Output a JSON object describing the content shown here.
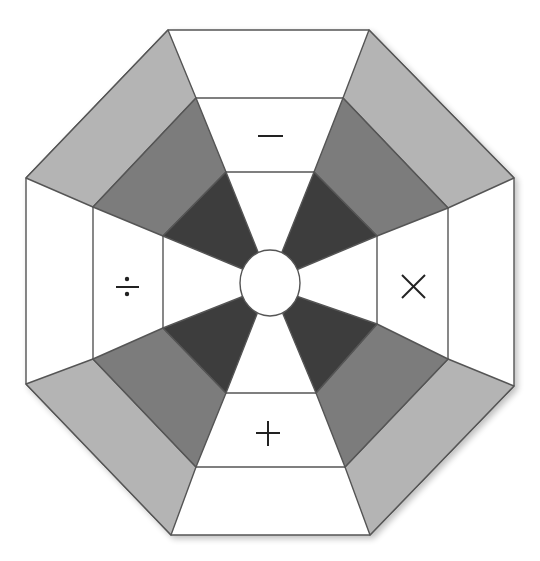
{
  "diagram": {
    "title": "",
    "shape": "octagon",
    "colors": {
      "background": "#ffffff",
      "white_segment": "#ffffff",
      "light_gray": "#b4b4b4",
      "mid_gray": "#7b7b7b",
      "dark_gray": "#3c3c3c",
      "outline": "#555555",
      "symbol": "#222222"
    },
    "operators": [
      {
        "position": "top",
        "symbol": "−",
        "name": "minus"
      },
      {
        "position": "right",
        "symbol": "×",
        "name": "multiply"
      },
      {
        "position": "bottom",
        "symbol": "+",
        "name": "plus"
      },
      {
        "position": "left",
        "symbol": "÷",
        "name": "divide"
      }
    ],
    "rings": [
      "outer",
      "middle",
      "inner",
      "center"
    ],
    "corner_wedges": [
      {
        "position": "top-left",
        "bands": [
          "light_gray",
          "mid_gray",
          "dark_gray"
        ]
      },
      {
        "position": "top-right",
        "bands": [
          "light_gray",
          "mid_gray",
          "dark_gray"
        ]
      },
      {
        "position": "bottom-right",
        "bands": [
          "light_gray",
          "mid_gray",
          "dark_gray"
        ]
      },
      {
        "position": "bottom-left",
        "bands": [
          "light_gray",
          "mid_gray",
          "dark_gray"
        ]
      }
    ]
  }
}
